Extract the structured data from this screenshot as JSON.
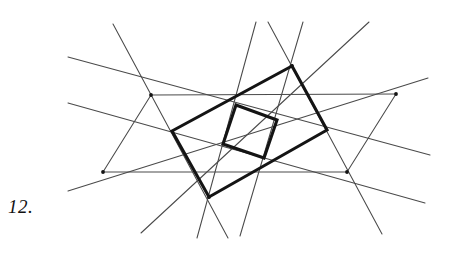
{
  "figure": {
    "label": "12.",
    "label_style": "italic-serif",
    "background_color": "#ffffff",
    "ink_color_thick": "#141414",
    "ink_color_thin": "#4a4a4a",
    "canvas": {
      "width": 452,
      "height": 257
    }
  },
  "chart_data": {
    "type": "diagram",
    "title": "12.",
    "xlabel": "",
    "ylabel": "",
    "xlim": [
      0,
      452
    ],
    "ylim": [
      0,
      257
    ],
    "grid": false,
    "legend": "none",
    "thick_outer_quad": {
      "stroke_width": 3.1,
      "color": "#141414",
      "vertices": [
        {
          "name": "top",
          "x": 292,
          "y": 66
        },
        {
          "name": "right",
          "x": 327,
          "y": 130
        },
        {
          "name": "bottom",
          "x": 209,
          "y": 197
        },
        {
          "name": "left",
          "x": 172,
          "y": 131
        }
      ]
    },
    "thick_inner_quad": {
      "stroke_width": 3.1,
      "color": "#141414",
      "vertices": [
        {
          "name": "top",
          "x": 236,
          "y": 105
        },
        {
          "name": "right",
          "x": 277,
          "y": 120
        },
        {
          "name": "bottom",
          "x": 264,
          "y": 158
        },
        {
          "name": "left",
          "x": 223,
          "y": 144
        }
      ]
    },
    "thin_lines": [
      {
        "name": "horizontal-upper",
        "x1": 151,
        "y1": 95,
        "x2": 396,
        "y2": 94
      },
      {
        "name": "horizontal-lower",
        "x1": 103,
        "y1": 172,
        "x2": 347,
        "y2": 172
      },
      {
        "name": "parallelogram-side-left",
        "x1": 103,
        "y1": 172,
        "x2": 151,
        "y2": 95
      },
      {
        "name": "parallelogram-side-right",
        "x1": 347,
        "y1": 172,
        "x2": 396,
        "y2": 94
      },
      {
        "name": "transversal-upper-left-to-right",
        "x1": 68,
        "y1": 57,
        "x2": 430,
        "y2": 155
      },
      {
        "name": "transversal-lower-left-to-right",
        "x1": 68,
        "y1": 103,
        "x2": 425,
        "y2": 203
      },
      {
        "name": "transversal-steep-a",
        "x1": 113,
        "y1": 24,
        "x2": 228,
        "y2": 238
      },
      {
        "name": "transversal-steep-b",
        "x1": 256,
        "y1": 22,
        "x2": 197,
        "y2": 238
      },
      {
        "name": "transversal-steep-c",
        "x1": 268,
        "y1": 22,
        "x2": 382,
        "y2": 234
      },
      {
        "name": "transversal-steep-d",
        "x1": 303,
        "y1": 22,
        "x2": 240,
        "y2": 236
      },
      {
        "name": "transversal-rising-right",
        "x1": 141,
        "y1": 233,
        "x2": 369,
        "y2": 22
      },
      {
        "name": "transversal-rising-far-right",
        "x1": 68,
        "y1": 191,
        "x2": 428,
        "y2": 78
      }
    ],
    "marked_nodes": [
      {
        "x": 151,
        "y": 95
      },
      {
        "x": 396,
        "y": 94
      },
      {
        "x": 103,
        "y": 172
      },
      {
        "x": 347,
        "y": 172
      },
      {
        "x": 292,
        "y": 66
      },
      {
        "x": 209,
        "y": 197
      }
    ]
  }
}
